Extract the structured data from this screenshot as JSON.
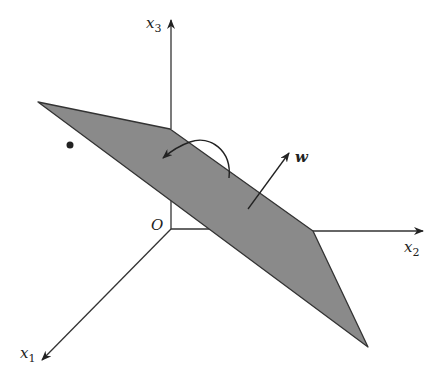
{
  "figure": {
    "colors": {
      "plane_fill": "#8a8a8a",
      "plane_edge": "#333333",
      "axis": "#333333",
      "background": "#ffffff"
    },
    "axes": {
      "x1": {
        "base": "x",
        "sub": "1"
      },
      "x2": {
        "base": "x",
        "sub": "2"
      },
      "x3": {
        "base": "x",
        "sub": "3"
      },
      "origin": "O"
    },
    "vector_label": "w",
    "point": "data point (dot)"
  }
}
